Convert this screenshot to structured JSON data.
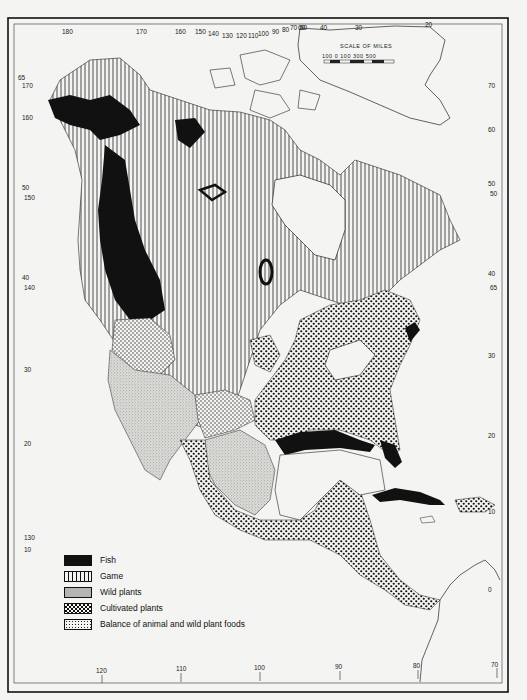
{
  "map": {
    "title": "North America food sources",
    "scale": {
      "title": "SCALE OF MILES",
      "labels": [
        "100",
        "0",
        "100",
        "300",
        "500"
      ]
    },
    "top_longitude_labels": [
      "180",
      "170",
      "160",
      "150",
      "140",
      "130",
      "120",
      "110",
      "100",
      "90",
      "80",
      "70",
      "60",
      "50",
      "40",
      "30",
      "20"
    ],
    "bottom_longitude_labels": [
      "120",
      "110",
      "100",
      "90",
      "80",
      "70"
    ],
    "left_latitude_labels": [
      "65",
      "170",
      "60",
      "160",
      "50",
      "150",
      "40",
      "140",
      "30",
      "20",
      "130",
      "10"
    ],
    "right_latitude_labels": [
      "70",
      "60",
      "50",
      "50",
      "40",
      "65",
      "30",
      "20",
      "10",
      "0"
    ]
  },
  "legend": {
    "items": [
      {
        "label": "Fish",
        "pattern": "solid-black"
      },
      {
        "label": "Game",
        "pattern": "vertical-lines"
      },
      {
        "label": "Wild plants",
        "pattern": "fine-stipple"
      },
      {
        "label": "Cultivated plants",
        "pattern": "checker-dots"
      },
      {
        "label": "Balance of animal and wild plant foods",
        "pattern": "sparse-dots"
      }
    ]
  },
  "colors": {
    "ink": "#111111",
    "paper": "#f4f4f2"
  }
}
